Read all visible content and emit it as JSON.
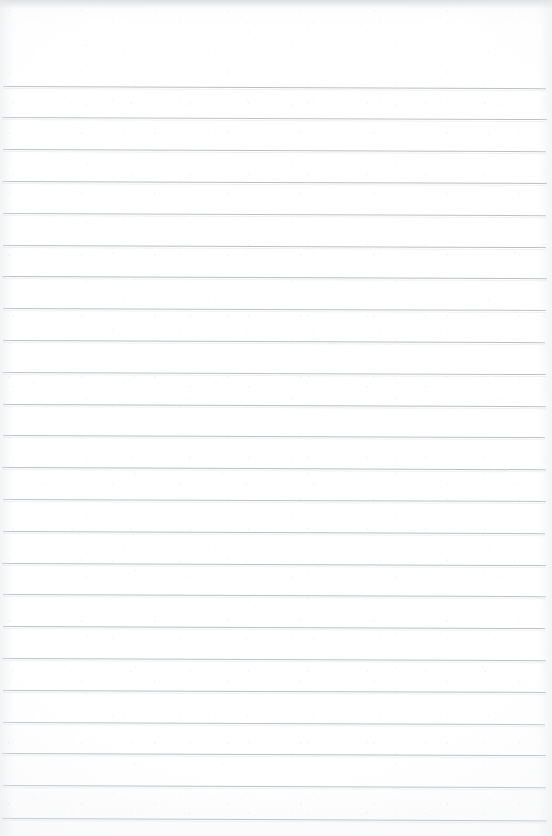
{
  "document": {
    "type": "scanned-lined-notebook-page",
    "title": "Blank ruled notebook page",
    "orientation": "portrait",
    "page_width_px": 552,
    "page_height_px": 836,
    "background_color": "#ffffff",
    "has_written_content": false,
    "has_margin_rule": false,
    "has_header_text": false,
    "has_page_number": false,
    "content_text": ""
  },
  "ruling": {
    "line_color": "#b5babf",
    "line_thickness_px": 1,
    "line_spacing_px": 31.8,
    "first_line_y_px": 85.5,
    "last_line_y_px": 818,
    "line_left_x_px": 3,
    "line_right_x_px": 546,
    "line_count": 24,
    "skew_deg": 0.22,
    "lines": [
      {
        "index": 1,
        "y": 85.5,
        "left": 3,
        "right": 546,
        "skew": 0.24,
        "opacity": 0.92
      },
      {
        "index": 2,
        "y": 117.3,
        "left": 2,
        "right": 547,
        "skew": 0.22,
        "opacity": 0.88
      },
      {
        "index": 3,
        "y": 149.1,
        "left": 3,
        "right": 546,
        "skew": 0.23,
        "opacity": 0.9
      },
      {
        "index": 4,
        "y": 180.9,
        "left": 2,
        "right": 547,
        "skew": 0.21,
        "opacity": 0.93
      },
      {
        "index": 5,
        "y": 212.7,
        "left": 3,
        "right": 546,
        "skew": 0.24,
        "opacity": 0.87
      },
      {
        "index": 6,
        "y": 244.5,
        "left": 3,
        "right": 546,
        "skew": 0.22,
        "opacity": 0.91
      },
      {
        "index": 7,
        "y": 276.3,
        "left": 2,
        "right": 547,
        "skew": 0.23,
        "opacity": 0.94
      },
      {
        "index": 8,
        "y": 308.1,
        "left": 3,
        "right": 546,
        "skew": 0.21,
        "opacity": 0.89
      },
      {
        "index": 9,
        "y": 339.9,
        "left": 3,
        "right": 545,
        "skew": 0.24,
        "opacity": 0.92
      },
      {
        "index": 10,
        "y": 371.7,
        "left": 2,
        "right": 546,
        "skew": 0.22,
        "opacity": 0.88
      },
      {
        "index": 11,
        "y": 403.5,
        "left": 3,
        "right": 546,
        "skew": 0.23,
        "opacity": 0.93
      },
      {
        "index": 12,
        "y": 435.3,
        "left": 3,
        "right": 545,
        "skew": 0.22,
        "opacity": 0.9
      },
      {
        "index": 13,
        "y": 467.1,
        "left": 2,
        "right": 546,
        "skew": 0.24,
        "opacity": 0.94
      },
      {
        "index": 14,
        "y": 498.9,
        "left": 3,
        "right": 546,
        "skew": 0.21,
        "opacity": 0.88
      },
      {
        "index": 15,
        "y": 530.7,
        "left": 3,
        "right": 545,
        "skew": 0.23,
        "opacity": 0.92
      },
      {
        "index": 16,
        "y": 562.5,
        "left": 2,
        "right": 546,
        "skew": 0.22,
        "opacity": 0.91
      },
      {
        "index": 17,
        "y": 594.3,
        "left": 3,
        "right": 546,
        "skew": 0.24,
        "opacity": 0.89
      },
      {
        "index": 18,
        "y": 626.1,
        "left": 3,
        "right": 545,
        "skew": 0.22,
        "opacity": 0.93
      },
      {
        "index": 19,
        "y": 657.9,
        "left": 2,
        "right": 546,
        "skew": 0.23,
        "opacity": 0.9
      },
      {
        "index": 20,
        "y": 689.7,
        "left": 3,
        "right": 546,
        "skew": 0.21,
        "opacity": 0.92
      },
      {
        "index": 21,
        "y": 721.5,
        "left": 3,
        "right": 545,
        "skew": 0.24,
        "opacity": 0.88
      },
      {
        "index": 22,
        "y": 753.3,
        "left": 2,
        "right": 546,
        "skew": 0.22,
        "opacity": 0.93
      },
      {
        "index": 23,
        "y": 785.1,
        "left": 3,
        "right": 546,
        "skew": 0.23,
        "opacity": 0.91
      },
      {
        "index": 24,
        "y": 817.5,
        "left": 2,
        "right": 547,
        "skew": 0.25,
        "opacity": 0.94
      }
    ]
  },
  "scan_artifacts": {
    "top_band_color": "#d6d9dd",
    "edge_shadow_color": "#e6e8eb",
    "vignette_color": "#eef0f2"
  }
}
